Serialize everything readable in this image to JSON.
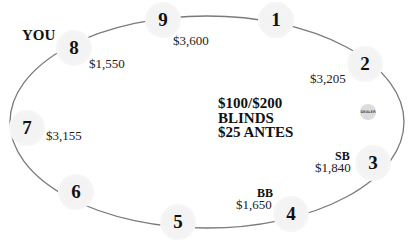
{
  "table": {
    "player_label": "YOU",
    "blinds_line1": "$100/$200",
    "blinds_line2": "BLINDS",
    "antes": "$25 ANTES",
    "dealer_button": "DEALER",
    "line_color": "#7a7a7a",
    "seat_color": "#f2f2f2"
  },
  "seats": [
    {
      "number": "1",
      "stack": "",
      "tag": ""
    },
    {
      "number": "2",
      "stack": "$3,205",
      "tag": ""
    },
    {
      "number": "3",
      "stack": "$1,840",
      "tag": "SB"
    },
    {
      "number": "4",
      "stack": "$1,650",
      "tag": "BB"
    },
    {
      "number": "5",
      "stack": "",
      "tag": ""
    },
    {
      "number": "6",
      "stack": "",
      "tag": ""
    },
    {
      "number": "7",
      "stack": "$3,155",
      "tag": ""
    },
    {
      "number": "8",
      "stack": "$1,550",
      "tag": ""
    },
    {
      "number": "9",
      "stack": "$3,600",
      "tag": ""
    }
  ]
}
